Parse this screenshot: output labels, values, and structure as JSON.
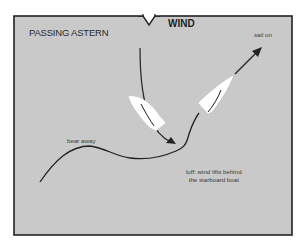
{
  "diagram": {
    "title": "PASSING ASTERN",
    "wind_label": "WIND",
    "wind_icon": "wind-direction-arrow-down",
    "labels": {
      "sail_on": "sail on",
      "bear_away": "bear away",
      "luff_line1": "luff: wind lifts behind",
      "luff_line2": "the starboard boat"
    },
    "boats": [
      {
        "name": "port-tack-boat",
        "role": "bears away and passes astern"
      },
      {
        "name": "starboard-tack-boat",
        "role": "sails on"
      }
    ],
    "colors": {
      "background": "#c9c9c9",
      "frame": "#222222",
      "boat_fill": "#ffffff",
      "track": "#222222",
      "text": "#2a2a2a"
    }
  }
}
